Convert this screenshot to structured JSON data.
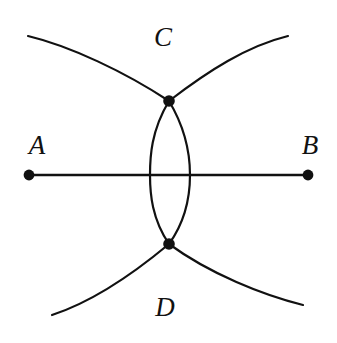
{
  "figure": {
    "background_color": "#ffffff",
    "stroke_color": "#111111",
    "width": 337,
    "height": 343,
    "labels": [
      {
        "id": "A",
        "text": "A",
        "x": 37,
        "y": 145
      },
      {
        "id": "B",
        "text": "B",
        "x": 310,
        "y": 145
      },
      {
        "id": "C",
        "text": "C",
        "x": 163,
        "y": 37
      },
      {
        "id": "D",
        "text": "D",
        "x": 165,
        "y": 307
      }
    ],
    "points": [
      {
        "id": "A",
        "name": "endpoint-a",
        "x": 29,
        "y": 175,
        "r": 5.4
      },
      {
        "id": "B",
        "name": "endpoint-b",
        "x": 308,
        "y": 175,
        "r": 5.4
      },
      {
        "id": "C",
        "name": "arc-intersection-upper",
        "x": 169,
        "y": 101,
        "r": 5.8
      },
      {
        "id": "D",
        "name": "arc-intersection-lower",
        "x": 169,
        "y": 244,
        "r": 5.8
      }
    ],
    "segment": {
      "name": "segment-ab",
      "x1": 29,
      "y1": 175,
      "x2": 308,
      "y2": 175
    },
    "arcs": [
      {
        "id": "arc-upper-left",
        "d": "M 28 36 C 70 46 125 72 169 101",
        "description": "long arc from upper left sweeping down to point C"
      },
      {
        "id": "arc-upper-right",
        "d": "M 288 36 C 247 46 208 71 169 101",
        "description": "long arc from upper right sweeping down to point C"
      },
      {
        "id": "arc-lower-left",
        "d": "M 52 315 C 92 302 133 274 169 244",
        "description": "long arc from lower left sweeping up to point D"
      },
      {
        "id": "arc-lower-right",
        "d": "M 303 305 C 263 295 210 274 169 244",
        "description": "long arc from lower right sweeping up to point D"
      }
    ],
    "lens": [
      {
        "id": "lens-left",
        "d": "M 169 101 C 151 131 150 157 150 175 C 150 194 152 219 169 244",
        "description": "left lens arc bulging toward A"
      },
      {
        "id": "lens-right",
        "d": "M 169 101 C 187 131 190 157 190 175 C 190 194 187 219 169 244",
        "description": "right lens arc bulging toward B"
      }
    ]
  }
}
